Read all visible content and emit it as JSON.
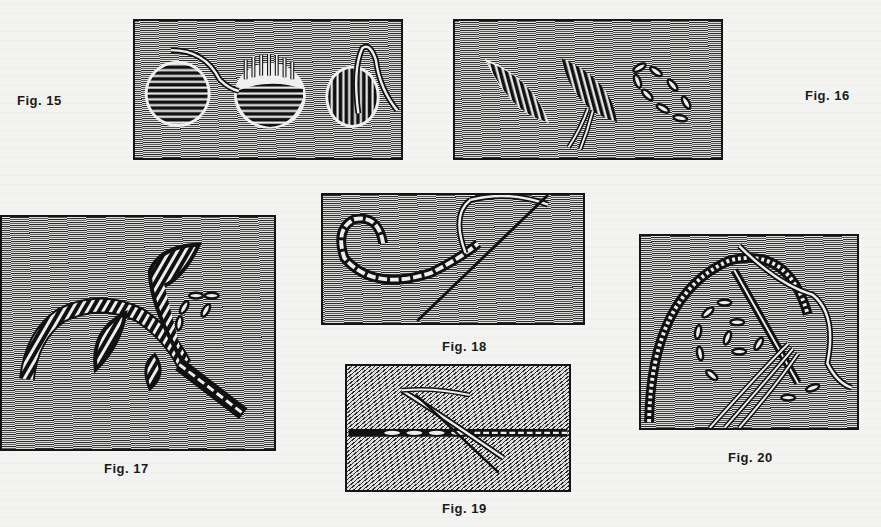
{
  "document": {
    "type": "embroidery stitch illustrations plate",
    "figures": [
      {
        "id": "fig15",
        "caption": "Fig. 15",
        "depicts": "satin-stitch dots: filled circle, circle being padded, circle being worked"
      },
      {
        "id": "fig16",
        "caption": "Fig. 16",
        "depicts": "satin-stitch leaves: filled leaf, leaf being worked with thread, outline of running stitches"
      },
      {
        "id": "fig17",
        "caption": "Fig. 17",
        "depicts": "floral spray with satin-stitch leaves, stem stitch and detached loops"
      },
      {
        "id": "fig18",
        "caption": "Fig. 18",
        "depicts": "stem stitch curve with needle and thread"
      },
      {
        "id": "fig19",
        "caption": "Fig. 19",
        "depicts": "running stitch line with needle"
      },
      {
        "id": "fig20",
        "caption": "Fig. 20",
        "depicts": "beaded arc with running-stitch spiral and needle with threads"
      }
    ]
  },
  "colors": {
    "ink": "#141414",
    "paper": "#f3f3f1",
    "fabric_light": "#e2e2e0"
  }
}
